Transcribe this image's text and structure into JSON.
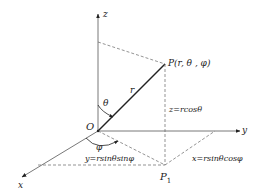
{
  "diagram": {
    "colors": {
      "line": "#444444",
      "vector": "#222222",
      "text": "#222222",
      "background": "#ffffff"
    },
    "labels": {
      "z_axis": "z",
      "y_axis": "y",
      "x_axis": "x",
      "origin": "O",
      "point": "P(r, θ , φ)",
      "projection": "P",
      "projection_sub": "1",
      "radius": "r",
      "theta": "θ",
      "phi": "φ",
      "z_formula": "z=rcosθ",
      "y_formula": "y=rsinθsinφ",
      "x_formula": "x=rsinθcosφ"
    }
  }
}
